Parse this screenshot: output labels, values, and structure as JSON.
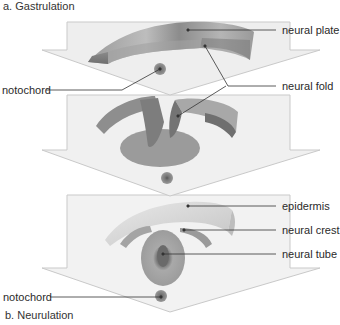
{
  "captions": {
    "top": "a. Gastrulation",
    "bottom": "b.  Neurulation"
  },
  "labels": {
    "neural_plate": "neural plate",
    "notochord_top": "notochord",
    "neural_fold": "neural fold",
    "epidermis": "epidermis",
    "neural_crest": "neural crest",
    "neural_tube": "neural tube",
    "notochord_bottom": "notochord"
  },
  "colors": {
    "arrow_fill": "#f0f0f0",
    "arrow_stroke": "#c8c8c8",
    "tissue_dark": "#8a8a8a",
    "tissue_mid": "#a8a8a8",
    "tissue_light": "#cfcfcf",
    "leader_line": "#333333"
  }
}
